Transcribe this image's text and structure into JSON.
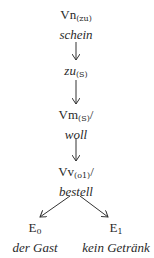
{
  "nodes": {
    "root": {
      "label": "Vn",
      "sub": "(zu)",
      "suffix": "",
      "word": "schein"
    },
    "zu": {
      "label": "zu",
      "sub": "(S)",
      "suffix": "",
      "word": ""
    },
    "modal": {
      "label": "Vm",
      "sub": "(S)",
      "suffix": "/",
      "word": "woll"
    },
    "verb": {
      "label": "Vv",
      "sub": "(o1)",
      "suffix": "/",
      "word": "bestell"
    },
    "e0": {
      "label": "E",
      "sub": "0",
      "word": "der Gast"
    },
    "e1": {
      "label": "E",
      "sub": "1",
      "word": "kein Getränk"
    }
  }
}
